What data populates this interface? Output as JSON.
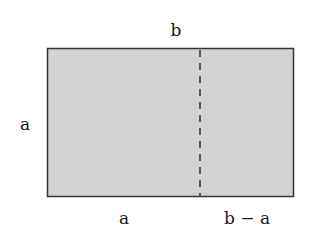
{
  "diagram": {
    "labels": {
      "top": "b",
      "left": "a",
      "bottom_left": "a",
      "bottom_right": "b − a"
    },
    "rectangle": {
      "fill": "#d3d3d3",
      "stroke": "#333333"
    },
    "divider": {
      "style": "dashed",
      "stroke": "#333333"
    }
  }
}
